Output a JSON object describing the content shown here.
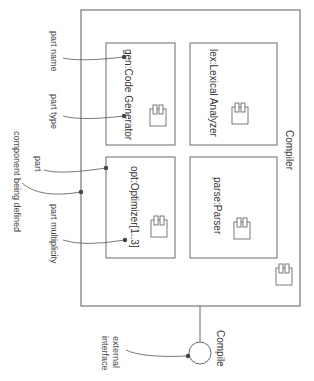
{
  "diagram": {
    "type": "UML component diagram (composite structure)",
    "orientation": "rotated 90 degrees clockwise",
    "component": {
      "name": "Compiler",
      "parts": [
        {
          "label": "gen:Code Generator",
          "name": "gen",
          "type": "Code Generator"
        },
        {
          "label": "lex:Lexical Analyzer",
          "name": "lex",
          "type": "Lexical Analyzer"
        },
        {
          "label": "opt:Optimizer[1..3]",
          "name": "opt",
          "type": "Optimizer",
          "multiplicity": "[1..3]"
        },
        {
          "label": "parse:Parser",
          "name": "parse",
          "type": "Parser"
        }
      ],
      "interface": {
        "label": "Compile"
      }
    },
    "annotations": {
      "part_name": "part name",
      "part_type": "part type",
      "part": "part",
      "component_being_defined": "component being defined",
      "part_multiplicity": "part multiplicity",
      "external_interface_line1": "external",
      "external_interface_line2": "interface"
    }
  },
  "colors": {
    "line": "#6b6b6b",
    "text": "#333333",
    "background": "#ffffff"
  }
}
